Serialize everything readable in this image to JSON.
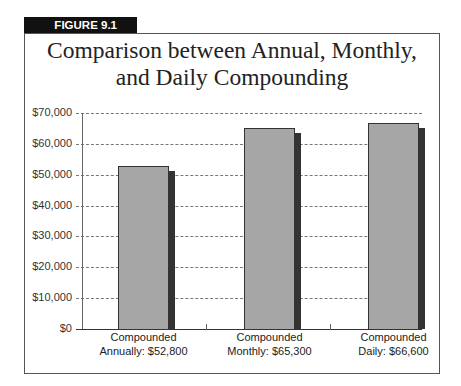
{
  "figure": {
    "label": "FIGURE 9.1",
    "title_line1": "Comparison between Annual, Monthly,",
    "title_line2": "and Daily Compounding"
  },
  "chart_data": {
    "type": "bar",
    "title": "Comparison between Annual, Monthly, and Daily Compounding",
    "xlabel": "",
    "ylabel": "",
    "categories": [
      "Compounded Annually: $52,800",
      "Compounded Monthly: $65,300",
      "Compounded Daily: $66,600"
    ],
    "category_lines": [
      [
        "Compounded",
        "Annually: $52,800"
      ],
      [
        "Compounded",
        "Monthly: $65,300"
      ],
      [
        "Compounded",
        "Daily: $66,600"
      ]
    ],
    "values": [
      52800,
      65300,
      66600
    ],
    "ylim": [
      0,
      70000
    ],
    "yticks": [
      0,
      10000,
      20000,
      30000,
      40000,
      50000,
      60000,
      70000
    ],
    "ytick_labels": [
      "$0",
      "$10,000",
      "$20,000",
      "$30,000",
      "$40,000",
      "$50,000",
      "$60,000",
      "$70,000"
    ],
    "grid": true,
    "grid_style": "dashed",
    "legend": null,
    "colors": {
      "bar": "#a6a6a6",
      "shadow": "#333333"
    }
  }
}
